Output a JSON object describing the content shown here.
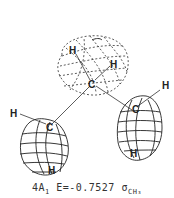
{
  "diagram": {
    "type": "molecular-orbital-plot",
    "lobes": [
      {
        "name": "top-lobe",
        "style": "dashed",
        "phase": "negative"
      },
      {
        "name": "left-lobe",
        "style": "solid",
        "phase": "positive"
      },
      {
        "name": "right-lobe",
        "style": "solid",
        "phase": "positive"
      }
    ],
    "atoms": {
      "top_h1": "H",
      "top_h2": "H",
      "top_c": "C",
      "left_h": "H",
      "left_c": "C",
      "left_h_bottom": "H",
      "right_h": "H",
      "right_c": "C",
      "right_h_bottom": "H"
    },
    "caption": {
      "state_num": "4A",
      "state_sub": "1",
      "energy": "E=-0.7527",
      "orbital_symbol": "σ",
      "orbital_sub": "CH₃"
    }
  }
}
